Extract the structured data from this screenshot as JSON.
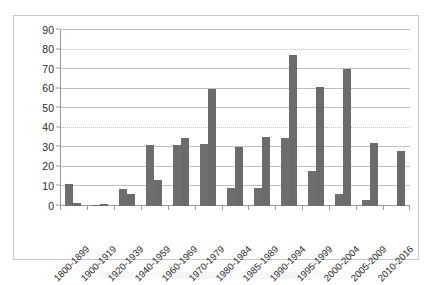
{
  "chart_data": {
    "type": "bar",
    "title": "",
    "subtitle": "",
    "xlabel": "",
    "ylabel": "",
    "ylim": [
      0,
      90
    ],
    "yticks": [
      0,
      10,
      20,
      30,
      40,
      50,
      60,
      70,
      80,
      90
    ],
    "grid": true,
    "legend": "none",
    "orientation": "vertical",
    "grouping": "grouped",
    "categories": [
      "1800-1899",
      "1900-1919",
      "1920-1939",
      "1940-1959",
      "1960-1969",
      "1970-1979",
      "1980-1984",
      "1985-1989",
      "1990-1994",
      "1995-1999",
      "2000-2004",
      "2005-2009",
      "2010-2016"
    ],
    "series": [
      {
        "name": "Series 1",
        "color": "#6e6e6e",
        "values": [
          11.5,
          0.5,
          8.5,
          31,
          31,
          31.5,
          9,
          9,
          35,
          18,
          6,
          3,
          0
        ]
      },
      {
        "name": "Series 2",
        "color": "#6b6b6b",
        "values": [
          1.5,
          1,
          6,
          13.5,
          35,
          60,
          30,
          35.5,
          77,
          61,
          70,
          32,
          28
        ]
      }
    ]
  },
  "axes": {
    "y_tick_labels": [
      "90",
      "80",
      "70",
      "60",
      "50",
      "40",
      "30",
      "20",
      "10",
      "0"
    ]
  },
  "figure": {
    "background_color": "#ffffff",
    "frame_color": "#c9c9c9",
    "gridline_color": "#bfbfbf",
    "axis_color": "#9a9a9a"
  }
}
